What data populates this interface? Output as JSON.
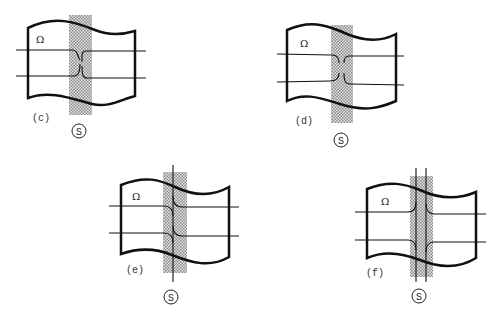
{
  "figure": {
    "panels": [
      {
        "id": "c",
        "label": "(c)",
        "region": "Ω",
        "strip_label": "S",
        "description": "two horizontal lines pinch toward each other inside the shaded strip, nearly touching"
      },
      {
        "id": "d",
        "label": "(d)",
        "region": "Ω",
        "strip_label": "S",
        "description": "horizontal lines turn away and terminate inside the strip, leaving a gap"
      },
      {
        "id": "e",
        "label": "(e)",
        "region": "Ω",
        "strip_label": "S",
        "description": "horizontal lines bend into a single vertical line running through the strip"
      },
      {
        "id": "f",
        "label": "(f)",
        "region": "Ω",
        "strip_label": "S",
        "description": "horizontal lines merge into two parallel vertical lines through the strip"
      }
    ],
    "colors": {
      "outline": "#111111",
      "strip_fill": "#b8b8b8",
      "background": "#ffffff"
    }
  }
}
